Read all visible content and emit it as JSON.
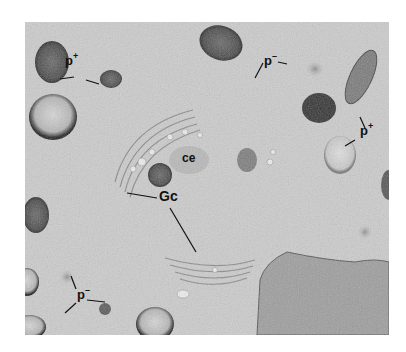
{
  "figure": {
    "type": "electron micrograph",
    "labels": [
      {
        "id": "p-plus-top-left",
        "base": "p",
        "sup": "+",
        "x": 65,
        "y": 40
      },
      {
        "id": "p-minus-top-right",
        "base": "p",
        "sup": "–",
        "x": 263,
        "y": 53
      },
      {
        "id": "p-plus-right",
        "base": "p",
        "sup": "+",
        "x": 362,
        "y": 115
      },
      {
        "id": "ce",
        "base": "ce",
        "sup": "",
        "x": 181,
        "y": 151
      },
      {
        "id": "Gc",
        "base": "Gc",
        "sup": "",
        "x": 160,
        "y": 190
      },
      {
        "id": "p-minus-bottom-left",
        "base": "p",
        "sup": "–",
        "x": 77,
        "y": 283
      }
    ]
  }
}
